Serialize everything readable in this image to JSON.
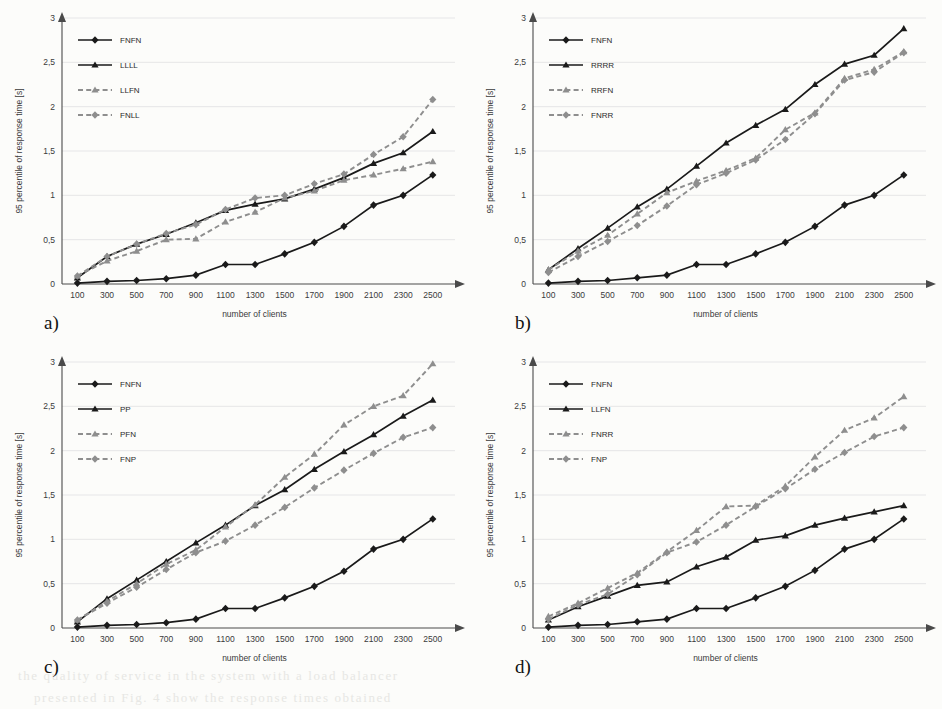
{
  "figure": {
    "background_color": "#fcfcfa",
    "axis_color": "#4a4a4a",
    "grid_color": "#dcdce0",
    "solid_series_color": "#1a1a1a",
    "dashed_series_color": "#8e8e8e"
  },
  "panels": [
    {
      "id": "a",
      "label": "a)",
      "chart_data": {
        "type": "line",
        "title": "",
        "xlabel": "number of clients",
        "ylabel": "95 percentile of response time [s]",
        "categories": [
          100,
          300,
          500,
          700,
          900,
          1100,
          1300,
          1500,
          1700,
          1900,
          2100,
          2300,
          2500
        ],
        "xticklabels": [
          "100",
          "300",
          "500",
          "700",
          "900",
          "1100",
          "1300",
          "1500",
          "1700",
          "1900",
          "2100",
          "2300",
          "2500"
        ],
        "yticklabels": [
          "0",
          "0,5",
          "1",
          "1,5",
          "2",
          "2,5",
          "3"
        ],
        "ytickvalues": [
          0,
          0.5,
          1,
          1.5,
          2,
          2.5,
          3
        ],
        "ylim": [
          0,
          3
        ],
        "grid": true,
        "legend_position": "top-left",
        "series": [
          {
            "name": "FNFN",
            "style": "solid",
            "marker": "diamond",
            "color": "#1a1a1a",
            "values": [
              0.01,
              0.03,
              0.04,
              0.06,
              0.1,
              0.22,
              0.22,
              0.34,
              0.47,
              0.65,
              0.89,
              1.0,
              1.23
            ]
          },
          {
            "name": "LLLL",
            "style": "solid",
            "marker": "triangle",
            "color": "#1a1a1a",
            "values": [
              0.07,
              0.31,
              0.45,
              0.56,
              0.69,
              0.83,
              0.9,
              0.96,
              1.07,
              1.2,
              1.36,
              1.48,
              1.72
            ]
          },
          {
            "name": "LLFN",
            "style": "dashed",
            "marker": "triangle",
            "color": "#8e8e8e",
            "values": [
              0.09,
              0.26,
              0.37,
              0.5,
              0.51,
              0.7,
              0.81,
              0.97,
              1.05,
              1.17,
              1.23,
              1.3,
              1.38
            ]
          },
          {
            "name": "FNLL",
            "style": "dashed",
            "marker": "diamond",
            "color": "#8e8e8e",
            "values": [
              0.09,
              0.31,
              0.45,
              0.57,
              0.67,
              0.84,
              0.97,
              1.0,
              1.13,
              1.24,
              1.46,
              1.66,
              2.08
            ]
          }
        ]
      }
    },
    {
      "id": "b",
      "label": "b)",
      "chart_data": {
        "type": "line",
        "title": "",
        "xlabel": "number of clients",
        "ylabel": "95 percentile of response time [s]",
        "categories": [
          100,
          300,
          500,
          700,
          900,
          1100,
          1300,
          1500,
          1700,
          1900,
          2100,
          2300,
          2500
        ],
        "xticklabels": [
          "100",
          "300",
          "500",
          "700",
          "900",
          "1100",
          "1300",
          "1500",
          "1700",
          "1900",
          "2100",
          "2300",
          "2500"
        ],
        "yticklabels": [
          "0",
          "0,5",
          "1",
          "1,5",
          "2",
          "2,5",
          "3"
        ],
        "ytickvalues": [
          0,
          0.5,
          1,
          1.5,
          2,
          2.5,
          3
        ],
        "ylim": [
          0,
          3
        ],
        "grid": true,
        "legend_position": "top-left",
        "series": [
          {
            "name": "FNFN",
            "style": "solid",
            "marker": "diamond",
            "color": "#1a1a1a",
            "values": [
              0.01,
              0.03,
              0.04,
              0.07,
              0.1,
              0.22,
              0.22,
              0.34,
              0.47,
              0.65,
              0.89,
              1.0,
              1.23
            ]
          },
          {
            "name": "RRRR",
            "style": "solid",
            "marker": "triangle",
            "color": "#1a1a1a",
            "values": [
              0.16,
              0.4,
              0.63,
              0.87,
              1.07,
              1.33,
              1.59,
              1.79,
              1.97,
              2.25,
              2.48,
              2.58,
              2.88
            ]
          },
          {
            "name": "RRFN",
            "style": "dashed",
            "marker": "triangle",
            "color": "#8e8e8e",
            "values": [
              0.16,
              0.37,
              0.55,
              0.79,
              1.03,
              1.16,
              1.28,
              1.42,
              1.74,
              1.93,
              2.32,
              2.42,
              2.62
            ]
          },
          {
            "name": "FNRR",
            "style": "dashed",
            "marker": "diamond",
            "color": "#8e8e8e",
            "values": [
              0.13,
              0.31,
              0.48,
              0.66,
              0.88,
              1.12,
              1.25,
              1.4,
              1.63,
              1.92,
              2.3,
              2.39,
              2.61
            ]
          }
        ]
      }
    },
    {
      "id": "c",
      "label": "c)",
      "chart_data": {
        "type": "line",
        "title": "",
        "xlabel": "number of clients",
        "ylabel": "95 percentile of response time [s]",
        "categories": [
          100,
          300,
          500,
          700,
          900,
          1100,
          1300,
          1500,
          1700,
          1900,
          2100,
          2300,
          2500
        ],
        "xticklabels": [
          "100",
          "300",
          "500",
          "700",
          "900",
          "1100",
          "1300",
          "1500",
          "1700",
          "1900",
          "2100",
          "2300",
          "2500"
        ],
        "yticklabels": [
          "0",
          "0,5",
          "1",
          "1,5",
          "2",
          "2,5",
          "3"
        ],
        "ytickvalues": [
          0,
          0.5,
          1,
          1.5,
          2,
          2.5,
          3
        ],
        "ylim": [
          0,
          3
        ],
        "grid": true,
        "legend_position": "top-left",
        "series": [
          {
            "name": "FNFN",
            "style": "solid",
            "marker": "diamond",
            "color": "#1a1a1a",
            "values": [
              0.01,
              0.03,
              0.04,
              0.06,
              0.1,
              0.22,
              0.22,
              0.34,
              0.47,
              0.64,
              0.89,
              1.0,
              1.23
            ]
          },
          {
            "name": "PP",
            "style": "solid",
            "marker": "triangle",
            "color": "#1a1a1a",
            "values": [
              0.07,
              0.33,
              0.54,
              0.75,
              0.96,
              1.16,
              1.38,
              1.56,
              1.79,
              1.99,
              2.18,
              2.39,
              2.57
            ]
          },
          {
            "name": "PFN",
            "style": "dashed",
            "marker": "triangle",
            "color": "#8e8e8e",
            "values": [
              0.09,
              0.3,
              0.5,
              0.72,
              0.88,
              1.14,
              1.39,
              1.7,
              1.96,
              2.29,
              2.5,
              2.62,
              2.98
            ]
          },
          {
            "name": "FNP",
            "style": "dashed",
            "marker": "diamond",
            "color": "#8e8e8e",
            "values": [
              0.09,
              0.28,
              0.46,
              0.66,
              0.85,
              0.98,
              1.16,
              1.36,
              1.58,
              1.78,
              1.97,
              2.15,
              2.26
            ]
          }
        ]
      }
    },
    {
      "id": "d",
      "label": "d)",
      "chart_data": {
        "type": "line",
        "title": "",
        "xlabel": "number of clients",
        "ylabel": "95 percentile of response time [s]",
        "categories": [
          100,
          300,
          500,
          700,
          900,
          1100,
          1300,
          1500,
          1700,
          1900,
          2100,
          2300,
          2500
        ],
        "xticklabels": [
          "100",
          "300",
          "500",
          "700",
          "900",
          "1100",
          "1300",
          "1500",
          "1700",
          "1900",
          "2100",
          "2300",
          "2500"
        ],
        "yticklabels": [
          "0",
          "0,5",
          "1",
          "1,5",
          "2",
          "2,5",
          "3"
        ],
        "ytickvalues": [
          0,
          0.5,
          1,
          1.5,
          2,
          2.5,
          3
        ],
        "ylim": [
          0,
          3
        ],
        "grid": true,
        "legend_position": "top-left",
        "series": [
          {
            "name": "FNFN",
            "style": "solid",
            "marker": "diamond",
            "color": "#1a1a1a",
            "values": [
              0.01,
              0.03,
              0.04,
              0.07,
              0.1,
              0.22,
              0.22,
              0.34,
              0.47,
              0.65,
              0.89,
              1.0,
              1.23
            ]
          },
          {
            "name": "LLFN",
            "style": "solid",
            "marker": "triangle",
            "color": "#1a1a1a",
            "values": [
              0.09,
              0.24,
              0.36,
              0.48,
              0.52,
              0.69,
              0.8,
              0.99,
              1.04,
              1.16,
              1.24,
              1.31,
              1.38
            ]
          },
          {
            "name": "FNRR",
            "style": "dashed",
            "marker": "triangle",
            "color": "#8e8e8e",
            "values": [
              0.13,
              0.28,
              0.45,
              0.62,
              0.86,
              1.1,
              1.37,
              1.38,
              1.6,
              1.93,
              2.23,
              2.37,
              2.61
            ]
          },
          {
            "name": "FNP",
            "style": "dashed",
            "marker": "diamond",
            "color": "#8e8e8e",
            "values": [
              0.1,
              0.26,
              0.38,
              0.6,
              0.85,
              0.97,
              1.16,
              1.37,
              1.57,
              1.79,
              1.98,
              2.16,
              2.26
            ]
          }
        ]
      }
    }
  ],
  "bleed_text": [
    "the quality of service  in  the  system  with  a  load  balancer",
    "presented  in Fig.  4  show  the  response  times  obtained"
  ]
}
